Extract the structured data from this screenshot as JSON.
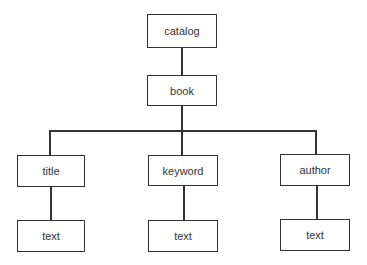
{
  "diagram": {
    "type": "tree",
    "nodes": {
      "catalog": {
        "label": "catalog"
      },
      "book": {
        "label": "book"
      },
      "title": {
        "label": "title"
      },
      "keyword": {
        "label": "keyword"
      },
      "author": {
        "label": "author"
      },
      "title_text": {
        "label": "text"
      },
      "keyword_text": {
        "label": "text"
      },
      "author_text": {
        "label": "text"
      }
    },
    "edges": [
      [
        "catalog",
        "book"
      ],
      [
        "book",
        "title"
      ],
      [
        "book",
        "keyword"
      ],
      [
        "book",
        "author"
      ],
      [
        "title",
        "title_text"
      ],
      [
        "keyword",
        "keyword_text"
      ],
      [
        "author",
        "author_text"
      ]
    ],
    "colors": {
      "stroke": "#333333",
      "fill": "#ffffff",
      "text": "#333333"
    }
  }
}
